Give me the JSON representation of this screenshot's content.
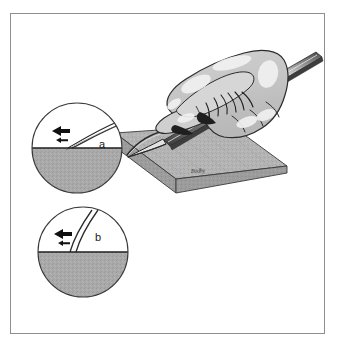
{
  "figure": {
    "domain_kind": "medical-surgical-illustration",
    "caption_labels": {
      "inset_a": "a",
      "inset_b": "b"
    },
    "signature": "Bodhy",
    "colors": {
      "page_background": "#ffffff",
      "frame_border": "#8e8e8e",
      "outline_stroke": "#2b2b2b",
      "tissue_gray": "#a9a9a9",
      "tissue_gray_dark": "#9a9a9a",
      "slab_top_gray": "#b4b4b4",
      "slab_edge_gray": "#9c9c9c",
      "hand_fill": "#c6c6c6",
      "hand_highlight": "#efefef",
      "blade_metal": "#d8d8d8",
      "blade_shadow": "#3a3a3a",
      "arrow_black": "#111111",
      "label_text": "#1a1a1a"
    },
    "scene": {
      "name": "hand-holding-scalpel-incising-tissue",
      "description": "A gloved hand grips a scalpel and makes an incision into a flat slab of tissue; two circular magnified insets show the cross-sectional angle of the cut."
    },
    "insets": [
      {
        "id": "a",
        "label": "a",
        "center_x": 77,
        "center_y": 148,
        "radius": 45,
        "surface_y": 148,
        "cut_angle_description": "shallow oblique bevelled incision",
        "arrows": [
          {
            "name": "tension-arrow-large",
            "direction": "left",
            "size": "large"
          },
          {
            "name": "tension-arrow-small",
            "direction": "left",
            "size": "small"
          }
        ]
      },
      {
        "id": "b",
        "label": "b",
        "center_x": 83,
        "center_y": 252,
        "radius": 45,
        "surface_y": 252,
        "cut_angle_description": "steep near-perpendicular incision",
        "arrows": [
          {
            "name": "tension-arrow-large",
            "direction": "left",
            "size": "large"
          },
          {
            "name": "tension-arrow-small",
            "direction": "left",
            "size": "small"
          }
        ]
      }
    ],
    "slab": {
      "name": "tissue-slab",
      "top_left_x": 115,
      "top_y": 133,
      "thickness_px": 14
    },
    "instrument": {
      "name": "scalpel",
      "tip_x": 127,
      "tip_y": 155,
      "handle_end_x": 322,
      "handle_end_y": 56
    }
  }
}
